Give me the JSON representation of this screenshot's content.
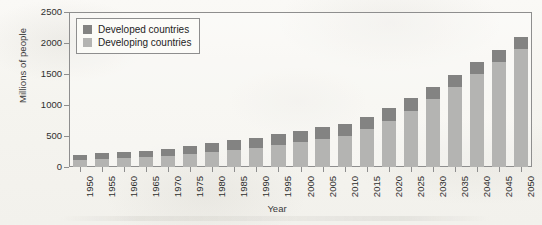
{
  "chart_data": {
    "type": "bar",
    "stacked": true,
    "title": "",
    "xlabel": "Year",
    "ylabel": "Millions of people",
    "ylim": [
      0,
      2500
    ],
    "yticks": [
      0,
      500,
      1000,
      1500,
      2000,
      2500
    ],
    "grid": false,
    "legend_position": "top-left",
    "categories": [
      "1950",
      "1955",
      "1960",
      "1965",
      "1970",
      "1975",
      "1980",
      "1985",
      "1990",
      "1995",
      "2000",
      "2005",
      "2010",
      "2015",
      "2020",
      "2025",
      "2030",
      "2035",
      "2040",
      "2045",
      "2050"
    ],
    "series": [
      {
        "name": "Developing countries",
        "color": "#b4b4b2",
        "values": [
          120,
          135,
          150,
          165,
          185,
          210,
          240,
          275,
          310,
          350,
          400,
          450,
          500,
          610,
          740,
          900,
          1090,
          1290,
          1500,
          1700,
          1900
        ]
      },
      {
        "name": "Developed countries",
        "color": "#838382",
        "values": [
          80,
          85,
          90,
          100,
          110,
          125,
          140,
          155,
          165,
          175,
          185,
          190,
          190,
          200,
          205,
          210,
          205,
          200,
          195,
          190,
          190
        ]
      }
    ],
    "totals": [
      200,
      220,
      240,
      265,
      295,
      335,
      380,
      430,
      475,
      525,
      585,
      640,
      690,
      810,
      945,
      1110,
      1295,
      1490,
      1695,
      1890,
      2090
    ]
  },
  "legend": {
    "items": [
      {
        "label": "Developed countries",
        "swatch": "developed"
      },
      {
        "label": "Developing countries",
        "swatch": "developing"
      }
    ]
  },
  "axes": {
    "y_title": "Millions of people",
    "x_title": "Year"
  }
}
